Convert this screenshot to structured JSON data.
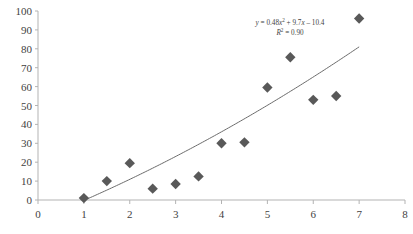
{
  "chart_data": {
    "type": "scatter",
    "title": "",
    "subtitle": "",
    "xlabel": "",
    "ylabel": "",
    "xlim": [
      0,
      8
    ],
    "ylim": [
      0,
      100
    ],
    "x_ticks": [
      "0",
      "1",
      "2",
      "3",
      "4",
      "5",
      "6",
      "7",
      "8"
    ],
    "y_ticks": [
      "0",
      "10",
      "20",
      "30",
      "40",
      "50",
      "60",
      "70",
      "80",
      "90",
      "100"
    ],
    "x_tick_values": [
      0,
      1,
      2,
      3,
      4,
      5,
      6,
      7,
      8
    ],
    "y_tick_values": [
      0,
      10,
      20,
      30,
      40,
      50,
      60,
      70,
      80,
      90,
      100
    ],
    "grid": false,
    "legend": "none",
    "marker_shape": "diamond",
    "marker_color": "#595959",
    "trendline_color": "#6b6b6b",
    "axis_color": "#b3b3b3",
    "series": [
      {
        "name": "data",
        "points": [
          {
            "x": 1.0,
            "y": 1.0
          },
          {
            "x": 1.5,
            "y": 10.0
          },
          {
            "x": 2.0,
            "y": 19.5
          },
          {
            "x": 2.5,
            "y": 6.0
          },
          {
            "x": 3.0,
            "y": 8.5
          },
          {
            "x": 3.5,
            "y": 12.5
          },
          {
            "x": 4.0,
            "y": 30.0
          },
          {
            "x": 4.5,
            "y": 30.5
          },
          {
            "x": 5.0,
            "y": 59.5
          },
          {
            "x": 5.5,
            "y": 75.5
          },
          {
            "x": 6.0,
            "y": 53.0
          },
          {
            "x": 6.5,
            "y": 55.0
          },
          {
            "x": 7.0,
            "y": 96.0
          }
        ]
      }
    ],
    "trendline": {
      "type": "polynomial",
      "order": 2,
      "a": 0.48,
      "b": 9.7,
      "c": -10.4,
      "x_start": 1.0,
      "x_end": 7.0,
      "r_squared": 0.9
    },
    "annotations": {
      "equation_line1_prefix": "y",
      "equation_line1_eq": " = 0.48",
      "equation_line1_x": "x",
      "equation_line1_exp": "2",
      "equation_line1_mid": " + 9.7",
      "equation_line1_x2": "x",
      "equation_line1_tail": " – 10.4",
      "equation_line2_r": "R",
      "equation_line2_exp": "2",
      "equation_line2_val": " = 0.90",
      "equation_full": "y = 0.48x² + 9.7x – 10.4",
      "r_squared_full": "R² = 0.90"
    }
  }
}
